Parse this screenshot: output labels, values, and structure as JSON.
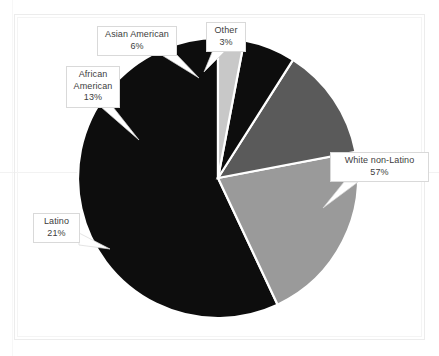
{
  "chart_data": {
    "type": "pie",
    "title": "",
    "subtitle": "",
    "xlabel": "",
    "ylabel": "",
    "legend_position": "none",
    "grid": false,
    "units": "percent",
    "start_angle_deg": 0,
    "direction": "counterclockwise",
    "center": {
      "x": 218,
      "y": 178
    },
    "radius": 140,
    "categories": [
      "White non-Latino",
      "Latino",
      "African American",
      "Asian American",
      "Other"
    ],
    "values": [
      57,
      21,
      13,
      6,
      3
    ],
    "colors": [
      "#0d0d0d",
      "#9a9a9a",
      "#5a5a5a",
      "#0d0d0d",
      "#c8c8c8"
    ],
    "slice_separator_color": "#ffffff",
    "slices": [
      {
        "label": "White non-Latino",
        "value": 57,
        "value_text": "57%",
        "color": "#0d0d0d",
        "start_deg": 0,
        "end_deg": 205.2
      },
      {
        "label": "Latino",
        "value": 21,
        "value_text": "21%",
        "color": "#9a9a9a",
        "start_deg": 205.2,
        "end_deg": 280.8
      },
      {
        "label": "African American",
        "value": 13,
        "value_text": "13%",
        "color": "#5a5a5a",
        "start_deg": 280.8,
        "end_deg": 327.6
      },
      {
        "label": "Asian American",
        "value": 6,
        "value_text": "6%",
        "color": "#0d0d0d",
        "start_deg": 327.6,
        "end_deg": 349.2
      },
      {
        "label": "Other",
        "value": 3,
        "value_text": "3%",
        "color": "#c8c8c8",
        "start_deg": 349.2,
        "end_deg": 360
      }
    ]
  },
  "labels": {
    "asian_american": {
      "line1": "Asian American",
      "line2": "6%"
    },
    "other": {
      "line1": "Other",
      "line2": "3%"
    },
    "african_american": {
      "line1": "African",
      "line2": "American",
      "line3": "13%"
    },
    "latino": {
      "line1": "Latino",
      "line2": "21%"
    },
    "white_non_latino": {
      "line1": "White non-Latino",
      "line2": "57%"
    }
  },
  "style": {
    "background": "#ffffff",
    "callout_fill": "#ffffff",
    "callout_border": "#d9d9d9",
    "text_color": "#3d3d3d",
    "frame_border": "#ececec"
  }
}
